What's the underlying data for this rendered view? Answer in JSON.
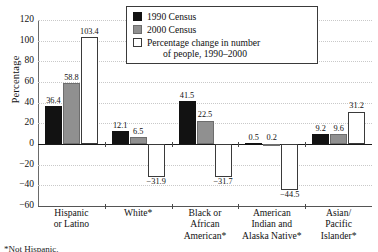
{
  "chart_data": {
    "type": "bar",
    "title": "",
    "xlabel": "",
    "ylabel": "Percentage",
    "ylim": [
      -60,
      120
    ],
    "ytick_step": 20,
    "yticks": [
      "120",
      "100",
      "80",
      "60",
      "40",
      "20",
      "0",
      "−20",
      "−40",
      "−60"
    ],
    "grid": true,
    "legend_position": "top-center",
    "categories": [
      "Hispanic or Latino",
      "White*",
      "Black or African American*",
      "American Indian and Alaska Native*",
      "Asian/ Pacific Islander*"
    ],
    "category_lines": [
      [
        "Hispanic",
        "or Latino"
      ],
      [
        "White*"
      ],
      [
        "Black or",
        "African",
        "American*"
      ],
      [
        "American",
        "Indian and",
        "Alaska Native*"
      ],
      [
        "Asian/",
        "Pacific",
        "Islander*"
      ]
    ],
    "series": [
      {
        "name": "1990 Census",
        "key": "c1990",
        "color": "#121212",
        "values": [
          36.4,
          12.1,
          41.5,
          0.5,
          9.2
        ],
        "labels": [
          "36.4",
          "12.1",
          "41.5",
          "0.5",
          "9.2"
        ]
      },
      {
        "name": "2000 Census",
        "key": "c2000",
        "color": "#909090",
        "values": [
          58.8,
          6.5,
          22.5,
          0.2,
          9.6
        ],
        "labels": [
          "58.8",
          "6.5",
          "22.5",
          "0.2",
          "9.6"
        ]
      },
      {
        "name": "Percentage change in number of people, 1990–2000",
        "key": "cchange",
        "color": "#ffffff",
        "values": [
          103.4,
          -31.9,
          -31.7,
          -44.5,
          31.2
        ],
        "labels": [
          "103.4",
          "−31.9",
          "−31.7",
          "−44.5",
          "31.2"
        ]
      }
    ]
  },
  "legend": {
    "items": [
      {
        "label": "1990 Census",
        "label2": "",
        "swatch": "c1990"
      },
      {
        "label": "2000 Census",
        "label2": "",
        "swatch": "c2000"
      },
      {
        "label": "Percentage change in number",
        "label2": "of people, 1990–2000",
        "swatch": "cchange"
      }
    ]
  },
  "axis": {
    "y_title": "Percentage"
  },
  "footnote": {
    "text": "*Not Hispanic."
  }
}
